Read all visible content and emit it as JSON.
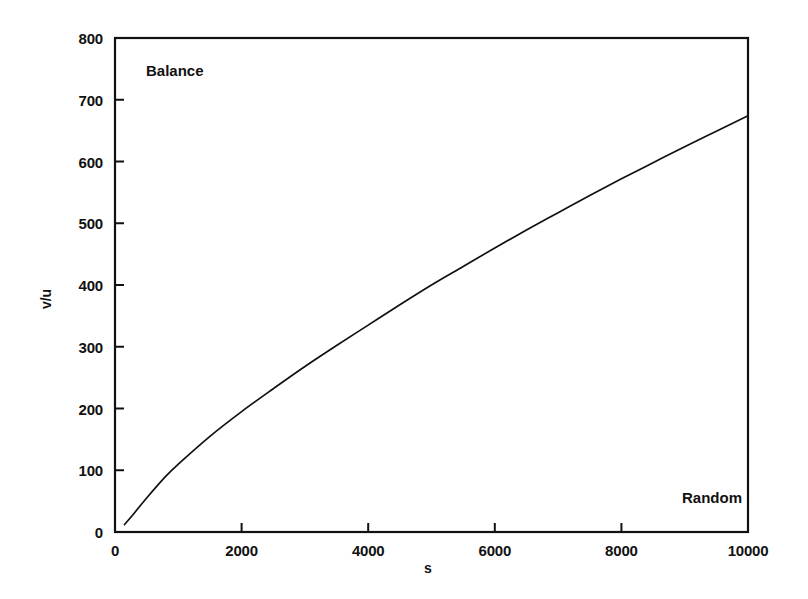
{
  "chart_data": {
    "type": "line",
    "title": "",
    "subtitle": "",
    "xlabel": "s",
    "ylabel": "v/u",
    "xlim": [
      0,
      10000
    ],
    "ylim": [
      0,
      800
    ],
    "grid": false,
    "legend": null,
    "xticks": [
      0,
      2000,
      4000,
      6000,
      8000,
      10000
    ],
    "xtick_labels": [
      "0",
      "2000",
      "4000",
      "6000",
      "8000",
      "10000"
    ],
    "yticks": [
      0,
      100,
      200,
      300,
      400,
      500,
      600,
      700,
      800
    ],
    "ytick_labels": [
      "0",
      "100",
      "200",
      "300",
      "400",
      "500",
      "600",
      "700",
      "800"
    ],
    "annotations": [
      {
        "text": "Balance",
        "x": 150,
        "y": 760,
        "position": "top-left"
      },
      {
        "text": "Random",
        "x": 9000,
        "y": 70,
        "position": "bottom-right"
      }
    ],
    "series": [
      {
        "name": "v/u",
        "color": "#111111",
        "x": [
          150,
          300,
          500,
          800,
          1000,
          1500,
          2000,
          2500,
          3000,
          3500,
          4000,
          4500,
          5000,
          5500,
          6000,
          6500,
          7000,
          7500,
          8000,
          8500,
          9000,
          9500,
          10000
        ],
        "y": [
          12,
          30,
          55,
          90,
          110,
          155,
          195,
          232,
          268,
          302,
          335,
          368,
          400,
          430,
          460,
          489,
          517,
          545,
          572,
          598,
          624,
          649,
          674
        ]
      }
    ]
  },
  "figure": {
    "background_color": "#ffffff",
    "ink_color": "#111111"
  }
}
